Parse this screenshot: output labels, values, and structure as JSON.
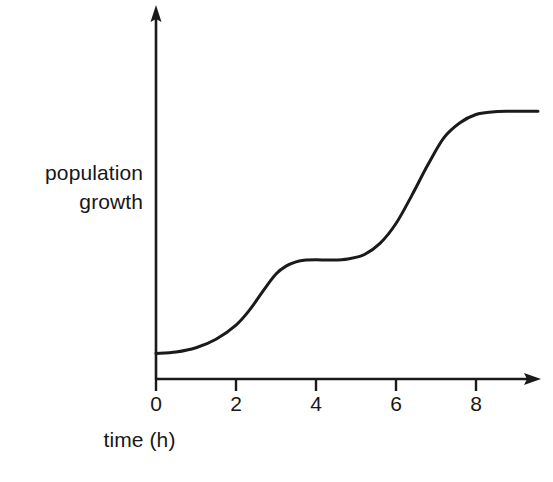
{
  "figure": {
    "kind": "line-graph",
    "background_color": "#ffffff",
    "ink_color": "#1a1a1a"
  },
  "axes": {
    "y_axis_title_line1": "population",
    "y_axis_title_line2": "growth",
    "x_axis_title": "time (h)",
    "x_tick_labels": [
      "0",
      "2",
      "4",
      "6",
      "8"
    ],
    "y_tick_labels": [],
    "has_x_arrow": true,
    "has_y_arrow": true,
    "grid": false
  },
  "chart_data": {
    "type": "line",
    "title": "",
    "subtitle": "",
    "xlabel": "time (h)",
    "ylabel": "population growth",
    "xlim": [
      0,
      9.6
    ],
    "ylim": [
      0,
      1.0
    ],
    "xticks": [
      0,
      2,
      4,
      6,
      8
    ],
    "xticklabels": [
      "0",
      "2",
      "4",
      "6",
      "8"
    ],
    "yticks": [],
    "yticklabels": [],
    "grid": false,
    "legend": null,
    "annotations": [],
    "series": [
      {
        "name": "population growth",
        "color": "#1a1a1a",
        "line_width": 3,
        "x": [
          0.0,
          0.5,
          1.0,
          1.5,
          2.0,
          2.35,
          2.7,
          3.0,
          3.25,
          3.5,
          3.75,
          4.0,
          4.4,
          4.8,
          5.2,
          5.6,
          6.0,
          6.4,
          6.8,
          7.2,
          7.6,
          8.0,
          8.4,
          8.8,
          9.2,
          9.55
        ],
        "y": [
          0.072,
          0.076,
          0.088,
          0.112,
          0.152,
          0.196,
          0.252,
          0.296,
          0.318,
          0.33,
          0.335,
          0.336,
          0.335,
          0.338,
          0.35,
          0.382,
          0.438,
          0.518,
          0.604,
          0.68,
          0.722,
          0.745,
          0.752,
          0.754,
          0.754,
          0.754
        ]
      }
    ],
    "key_points": {
      "start_value": 0.072,
      "first_plateau_value": 0.335,
      "first_plateau_range_h": [
        3.5,
        5.0
      ],
      "final_plateau_value": 0.754,
      "final_plateau_start_h": 8.1,
      "first_inflection_h": 2.35,
      "second_inflection_h": 6.75
    }
  }
}
